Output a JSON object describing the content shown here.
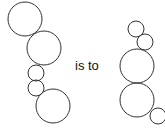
{
  "relation_text": "is to",
  "left_figure": {
    "circles": [
      {
        "cx": 25,
        "cy": 19,
        "r": 17
      },
      {
        "cx": 44,
        "cy": 48,
        "r": 17
      },
      {
        "cx": 36,
        "cy": 73,
        "r": 8
      },
      {
        "cx": 36,
        "cy": 88,
        "r": 8
      },
      {
        "cx": 53,
        "cy": 106,
        "r": 17
      }
    ]
  },
  "right_figure": {
    "circles": [
      {
        "cx": 136,
        "cy": 29,
        "r": 8
      },
      {
        "cx": 145,
        "cy": 42,
        "r": 8
      },
      {
        "cx": 137,
        "cy": 66,
        "r": 17
      },
      {
        "cx": 137,
        "cy": 100,
        "r": 17
      },
      {
        "cx": 158,
        "cy": 116,
        "r": 8
      }
    ]
  },
  "stroke_color": "#333333"
}
